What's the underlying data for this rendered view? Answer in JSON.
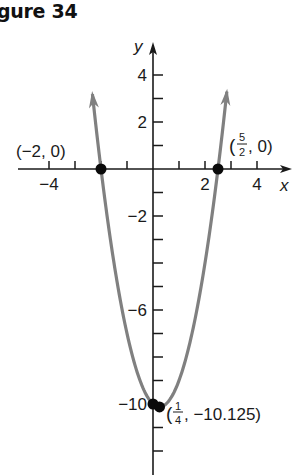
{
  "figure": {
    "title": "gure 34"
  },
  "chart_data": {
    "type": "line",
    "function": "y = 2x^2 - x - 10",
    "xlabel": "x",
    "ylabel": "y",
    "xlim": [
      -5.2,
      5.3
    ],
    "ylim": [
      -12.9,
      5.3
    ],
    "x_ticks": [
      -4,
      -3,
      -2,
      -1,
      1,
      2,
      3,
      4
    ],
    "x_tick_labels": [
      {
        "value": -4,
        "label": "−4"
      },
      {
        "value": 2,
        "label": "2"
      },
      {
        "value": 4,
        "label": "4"
      }
    ],
    "y_ticks": [
      4,
      3,
      2,
      1,
      -1,
      -2,
      -3,
      -4,
      -5,
      -6,
      -7,
      -8,
      -9,
      -10,
      -11,
      -12
    ],
    "y_tick_labels": [
      {
        "value": 4,
        "label": "4"
      },
      {
        "value": 2,
        "label": "2"
      },
      {
        "value": -2,
        "label": "−2"
      },
      {
        "value": -6,
        "label": "−6"
      },
      {
        "value": -10,
        "label": "−10"
      }
    ],
    "grid": false,
    "curve_domain": [
      -2.33,
      2.84
    ],
    "curve_color": "#808080",
    "points": [
      {
        "x": -2,
        "y": 0,
        "label": "(−2, 0)"
      },
      {
        "x": 2.5,
        "y": 0,
        "label_num": "5",
        "label_den": "2",
        "label_rest": ", 0)"
      },
      {
        "x": 0,
        "y": -10
      },
      {
        "x": 0.25,
        "y": -10.125,
        "label_num": "1",
        "label_den": "4",
        "label_rest": ", −10.125)"
      }
    ]
  }
}
